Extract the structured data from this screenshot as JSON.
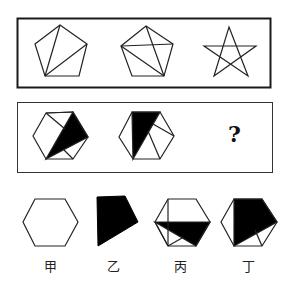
{
  "puzzle": {
    "row1": {
      "figures": [
        {
          "name": "pentagon-two-diagonals-from-vertex",
          "label": ""
        },
        {
          "name": "pentagon-three-diagonals",
          "label": ""
        },
        {
          "name": "pentagram-star",
          "label": ""
        }
      ]
    },
    "row2": {
      "figures": [
        {
          "name": "hexagon-shaded-1",
          "label": ""
        },
        {
          "name": "hexagon-shaded-2",
          "label": ""
        },
        {
          "name": "unknown",
          "label": "?"
        }
      ]
    },
    "options": [
      {
        "label": "甲",
        "name": "plain-hexagon"
      },
      {
        "label": "乙",
        "name": "black-quadrilateral"
      },
      {
        "label": "丙",
        "name": "hexagon-shaded-3"
      },
      {
        "label": "丁",
        "name": "hexagon-shaded-4"
      }
    ],
    "colors": {
      "stroke": "#1a1a1a",
      "fill": "#000000",
      "background": "#ffffff"
    }
  }
}
